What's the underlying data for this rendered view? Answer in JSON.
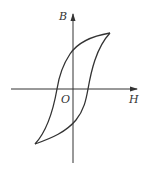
{
  "diagram": {
    "labels": {
      "y_axis": "B",
      "x_axis": "H",
      "origin": "O"
    },
    "colors": {
      "stroke": "#333333",
      "background": "#ffffff"
    },
    "geometry": {
      "origin": [
        73,
        89
      ],
      "x_axis": {
        "from": [
          11,
          89
        ],
        "to": [
          137,
          89
        ]
      },
      "y_axis": {
        "from": [
          73,
          163
        ],
        "to": [
          73,
          14
        ]
      },
      "loop_tip_positive": [
        110,
        33
      ],
      "loop_tip_negative": [
        35,
        144
      ],
      "remanence_positive": [
        73,
        51
      ],
      "remanence_negative": [
        73,
        123
      ],
      "coercivity_negative": [
        57,
        89
      ],
      "coercivity_positive": [
        88,
        89
      ]
    }
  }
}
